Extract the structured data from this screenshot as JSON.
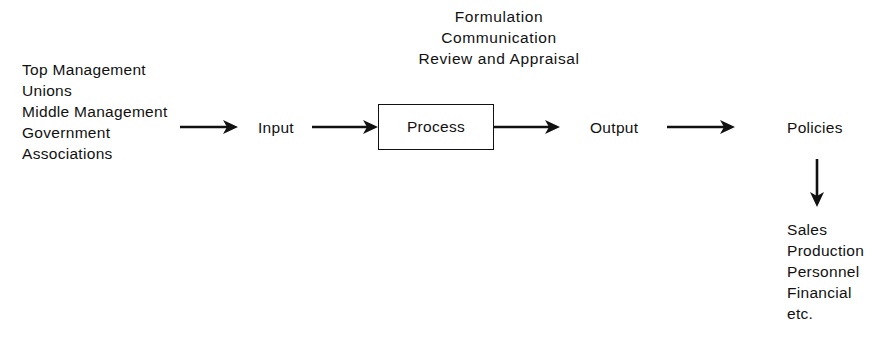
{
  "diagram": {
    "background_color": "#ffffff",
    "ink_color": "#111111",
    "header": {
      "lines": [
        "Formulation",
        "Communication",
        "Review and Appraisal"
      ]
    },
    "sources": {
      "lines": [
        "Top Management",
        "Unions",
        "Middle Management",
        "Government",
        "Associations"
      ]
    },
    "flow": {
      "input_label": "Input",
      "process_label": "Process",
      "output_label": "Output",
      "policies_label": "Policies"
    },
    "outcomes": {
      "lines": [
        "Sales",
        "Production",
        "Personnel",
        "Financial",
        "etc."
      ]
    },
    "connectors": {
      "arrow_1_name": "sources-to-input",
      "arrow_2_name": "input-to-process",
      "arrow_3_name": "process-to-output",
      "arrow_4_name": "output-to-policies",
      "arrow_5_name": "policies-to-outcomes"
    }
  }
}
